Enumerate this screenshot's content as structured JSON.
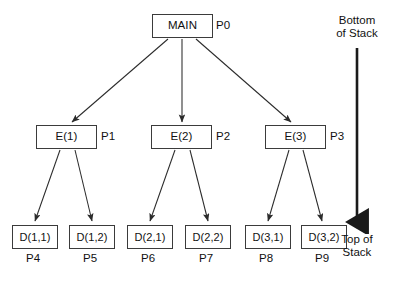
{
  "diagram": {
    "type": "tree",
    "nodes": [
      {
        "id": "main",
        "label": "MAIN",
        "process": "P0",
        "level": 0
      },
      {
        "id": "e1",
        "label": "E(1)",
        "process": "P1",
        "level": 1
      },
      {
        "id": "e2",
        "label": "E(2)",
        "process": "P2",
        "level": 1
      },
      {
        "id": "e3",
        "label": "E(3)",
        "process": "P3",
        "level": 1
      },
      {
        "id": "d11",
        "label": "D(1,1)",
        "process": "P4",
        "level": 2
      },
      {
        "id": "d12",
        "label": "D(1,2)",
        "process": "P5",
        "level": 2
      },
      {
        "id": "d21",
        "label": "D(2,1)",
        "process": "P6",
        "level": 2
      },
      {
        "id": "d22",
        "label": "D(2,2)",
        "process": "P7",
        "level": 2
      },
      {
        "id": "d31",
        "label": "D(3,1)",
        "process": "P8",
        "level": 2
      },
      {
        "id": "d32",
        "label": "D(3,2)",
        "process": "P9",
        "level": 2
      }
    ],
    "edges": [
      {
        "from": "main",
        "to": "e1"
      },
      {
        "from": "main",
        "to": "e2"
      },
      {
        "from": "main",
        "to": "e3"
      },
      {
        "from": "e1",
        "to": "d11"
      },
      {
        "from": "e1",
        "to": "d12"
      },
      {
        "from": "e2",
        "to": "d21"
      },
      {
        "from": "e2",
        "to": "d22"
      },
      {
        "from": "e3",
        "to": "d31"
      },
      {
        "from": "e3",
        "to": "d32"
      }
    ],
    "stack_axis": {
      "bottom_label": "Bottom\nof Stack",
      "top_label": "Top of\nStack",
      "direction": "downward"
    },
    "colors": {
      "background": "#ffffff",
      "node_border": "#3b3b3b",
      "node_fill": "#ffffff",
      "text": "#111111",
      "edge": "#2b2b2b",
      "stack_arrow": "#1a1a1a"
    }
  }
}
